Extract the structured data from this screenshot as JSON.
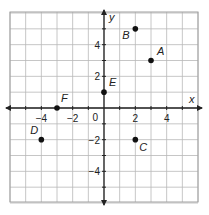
{
  "chart_data": {
    "type": "scatter",
    "title": "",
    "xlabel": "x",
    "ylabel": "y",
    "xlim": [
      -6,
      6
    ],
    "ylim": [
      -6,
      6
    ],
    "grid": true,
    "x_ticks": [
      {
        "value": -4,
        "label": "−4"
      },
      {
        "value": -2,
        "label": "−2"
      },
      {
        "value": 2,
        "label": "2"
      },
      {
        "value": 4,
        "label": "4"
      }
    ],
    "y_ticks": [
      {
        "value": 4,
        "label": "4"
      },
      {
        "value": 2,
        "label": "2"
      },
      {
        "value": -2,
        "label": "−2"
      },
      {
        "value": -4,
        "label": "−4"
      }
    ],
    "origin_label": "0",
    "points": [
      {
        "label": "A",
        "x": 3,
        "y": 3,
        "label_dx": 6,
        "label_dy": -6
      },
      {
        "label": "B",
        "x": 2,
        "y": 5,
        "label_dx": -13,
        "label_dy": 10
      },
      {
        "label": "C",
        "x": 2,
        "y": -2,
        "label_dx": 4,
        "label_dy": 11
      },
      {
        "label": "D",
        "x": -4,
        "y": -2,
        "label_dx": -11,
        "label_dy": -6
      },
      {
        "label": "E",
        "x": 0,
        "y": 1,
        "label_dx": 5,
        "label_dy": -6
      },
      {
        "label": "F",
        "x": -3,
        "y": 0,
        "label_dx": 4,
        "label_dy": -6
      }
    ]
  },
  "colors": {
    "grid": "#b8b8b8",
    "border": "#a0a0a0",
    "axis": "#222222",
    "point": "#111111",
    "text": "#222222"
  }
}
